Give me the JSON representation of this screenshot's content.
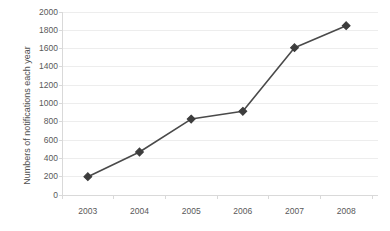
{
  "chart_data": {
    "type": "line",
    "title": "",
    "subtitle": "",
    "xlabel": "",
    "ylabel": "Numbers of notifications each year",
    "categories": [
      "2003",
      "2004",
      "2005",
      "2006",
      "2007",
      "2008"
    ],
    "values": [
      200,
      470,
      830,
      915,
      1610,
      1850
    ],
    "series": [
      {
        "name": "Notifications",
        "values": [
          200,
          470,
          830,
          915,
          1610,
          1850
        ]
      }
    ],
    "ylim": [
      0,
      2000
    ],
    "y_ticks": [
      0,
      200,
      400,
      600,
      800,
      1000,
      1200,
      1400,
      1600,
      1800,
      2000
    ],
    "y_tick_labels": [
      "0",
      "200",
      "400",
      "600",
      "800",
      "1000",
      "1200",
      "1400",
      "1600",
      "1800",
      "2000"
    ],
    "x_tick_labels": [
      "2003",
      "2004",
      "2005",
      "2006",
      "2007",
      "2008"
    ],
    "grid": true,
    "grid_axis": "y",
    "legend": false,
    "legend_position": "none",
    "annotations": [],
    "marker": "diamond"
  },
  "style": {
    "line_color": "#4a4a4a",
    "marker_color": "#3d3d3d",
    "grid_color": "#ededed",
    "axis_color": "#d9d9d9",
    "text_color": "#595959",
    "background": "#ffffff"
  }
}
